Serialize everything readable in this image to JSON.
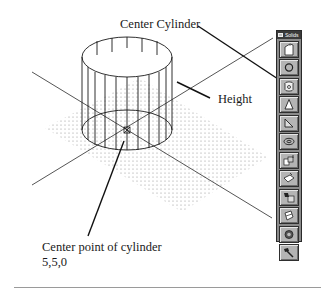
{
  "labels": {
    "center_cylinder": "Center Cylinder",
    "height": "Height",
    "center_point": "Center point of cylinder",
    "coordinates": "5,5,0"
  },
  "toolbar": {
    "title": "Solids",
    "buttons": [
      {
        "name": "box",
        "icon": "box-icon"
      },
      {
        "name": "sphere",
        "icon": "sphere-icon"
      },
      {
        "name": "cylinder",
        "icon": "cylinder-icon"
      },
      {
        "name": "cone",
        "icon": "cone-icon"
      },
      {
        "name": "wedge",
        "icon": "wedge-icon"
      },
      {
        "name": "torus",
        "icon": "torus-icon"
      },
      {
        "name": "extrude",
        "icon": "extrude-icon"
      },
      {
        "name": "revolve",
        "icon": "revolve-icon"
      },
      {
        "name": "slice",
        "icon": "slice-icon"
      },
      {
        "name": "section",
        "icon": "section-icon"
      },
      {
        "name": "interference",
        "icon": "interference-icon"
      },
      {
        "name": "setup",
        "icon": "setup-icon"
      }
    ]
  },
  "colors": {
    "line": "#1a1a1a",
    "toolbar_bg": "#8a8a8a",
    "button_bg": "#b4b4b4",
    "grid_dot": "#9a9a9a"
  }
}
